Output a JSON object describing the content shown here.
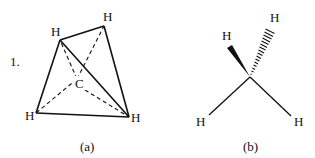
{
  "figure": {
    "number_label": "1.",
    "panel_a": {
      "caption": "(a)",
      "center_atom": "C",
      "atoms": {
        "top_left": "H",
        "top_right": "H",
        "bottom_left": "H",
        "bottom_right": "H"
      },
      "description": "Tetrahedral methane: solid tetrahedron edges, dashed C–H bonds"
    },
    "panel_b": {
      "caption": "(b)",
      "atoms": {
        "wedge": "H",
        "hash": "H",
        "bottom_left": "H",
        "bottom_right": "H"
      },
      "description": "Wedge-dash representation of methane"
    }
  },
  "colors": {
    "ink": "#111111",
    "background": "#ffffff"
  }
}
